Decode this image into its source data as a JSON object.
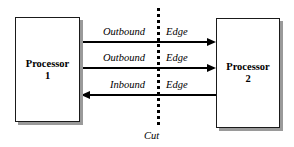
{
  "diagram": {
    "background_color": "#ffffff",
    "line_color": "#000000",
    "shadow_color": "#9a9a9a"
  },
  "nodes": [
    {
      "id": "processor-1",
      "label": "Processor",
      "number": "1"
    },
    {
      "id": "processor-2",
      "label": "Processor",
      "number": "2"
    }
  ],
  "edges": [
    {
      "id": "edge-1",
      "direction_label": "Outbound",
      "kind_label": "Edge",
      "arrow": "right",
      "from": "processor-1",
      "to": "processor-2"
    },
    {
      "id": "edge-2",
      "direction_label": "Outbound",
      "kind_label": "Edge",
      "arrow": "right",
      "from": "processor-1",
      "to": "processor-2"
    },
    {
      "id": "edge-3",
      "direction_label": "Inbound",
      "kind_label": "Edge",
      "arrow": "left",
      "from": "processor-2",
      "to": "processor-1"
    }
  ],
  "cut": {
    "label": "Cut",
    "style": "dotted-vertical"
  }
}
